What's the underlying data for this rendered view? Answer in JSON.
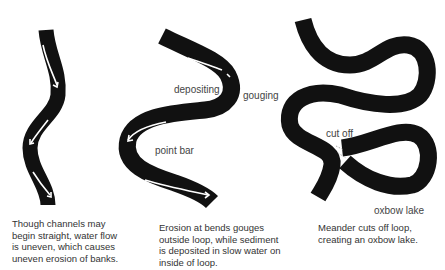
{
  "panels": [
    {
      "id": "straight-channel",
      "caption_lines": [
        "Though channels may",
        "begin straight, water flow",
        "is uneven, which causes",
        "uneven erosion of banks."
      ]
    },
    {
      "id": "meander",
      "labels": {
        "depositing": "depositing",
        "gouging": "gouging",
        "point_bar": "point bar"
      },
      "caption_lines": [
        "Erosion at bends gouges",
        "outside loop, while sediment",
        "is deposited in slow water on",
        "inside of loop."
      ]
    },
    {
      "id": "oxbow",
      "labels": {
        "cut_off": "cut off",
        "oxbow_lake": "oxbow lake"
      },
      "caption_lines": [
        "Meander cuts off loop,",
        "creating an oxbow lake."
      ]
    }
  ],
  "colors": {
    "channel": "#111111",
    "flow_arrow": "#ffffff",
    "text": "#333333"
  }
}
